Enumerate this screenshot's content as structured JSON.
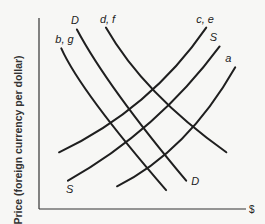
{
  "chart_data": {
    "type": "line",
    "title": "",
    "xlabel": "$",
    "ylabel": "Price (foreign currency per dollar)",
    "grid": false,
    "xlim": [
      0,
      10
    ],
    "ylim": [
      0,
      10
    ],
    "series": [
      {
        "name": "b, g",
        "kind": "demand",
        "label_at": "start",
        "points": [
          [
            1.0,
            8.5
          ],
          [
            2.6,
            5.5
          ],
          [
            5.7,
            1.0
          ]
        ]
      },
      {
        "name": "D",
        "kind": "demand",
        "label_at": "start",
        "points": [
          [
            1.7,
            9.5
          ],
          [
            3.6,
            6.0
          ],
          [
            6.6,
            1.5
          ]
        ]
      },
      {
        "name": "d, f",
        "kind": "demand",
        "label_at": "start",
        "points": [
          [
            3.0,
            9.6
          ],
          [
            5.2,
            6.2
          ],
          [
            8.4,
            3.0
          ]
        ]
      },
      {
        "name": "c, e",
        "kind": "supply",
        "label_at": "end",
        "points": [
          [
            0.9,
            3.0
          ],
          [
            4.6,
            5.8
          ],
          [
            7.5,
            9.6
          ]
        ]
      },
      {
        "name": "S",
        "kind": "supply",
        "label_at": "both",
        "points": [
          [
            1.3,
            1.5
          ],
          [
            5.0,
            4.6
          ],
          [
            8.1,
            8.6
          ]
        ]
      },
      {
        "name": "a",
        "kind": "supply",
        "label_at": "end",
        "points": [
          [
            3.5,
            1.2
          ],
          [
            6.4,
            3.7
          ],
          [
            8.8,
            7.5
          ]
        ]
      }
    ],
    "bottom_labels": [
      {
        "text": "S",
        "series": "S"
      },
      {
        "text": "D",
        "series": "D"
      }
    ]
  }
}
